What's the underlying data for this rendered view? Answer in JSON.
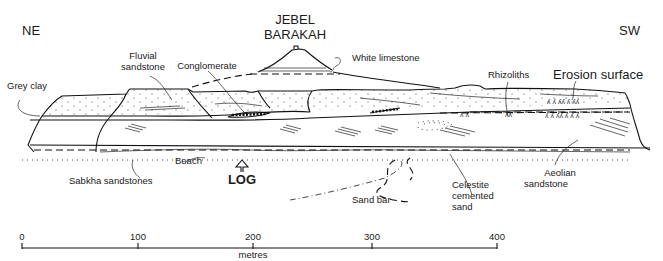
{
  "diagram": {
    "type": "geological cross-section",
    "orientation": {
      "left": "NE",
      "right": "SW"
    },
    "title": {
      "line1": "JEBEL",
      "line2": "BARAKAH"
    },
    "labels": {
      "white_limestone": "White limestone",
      "fluvial_sandstone_1": "Fluvial",
      "fluvial_sandstone_2": "sandstone",
      "conglomerate": "Conglomerate",
      "grey_clay": "Grey clay",
      "rhizoliths": "Rhizoliths",
      "erosion_surface": "Erosion surface",
      "beach": "Beach",
      "sabkha_sandstones": "Sabkha sandstones",
      "log": "LOG",
      "sand_bar": "Sand bar",
      "celestite_1": "Celestite",
      "celestite_2": "cemented",
      "celestite_3": "sand",
      "aeolian_1": "Aeolian",
      "aeolian_2": "sandstone"
    },
    "scale_bar": {
      "ticks": [
        "0",
        "100",
        "200",
        "300",
        "400"
      ],
      "unit": "metres"
    }
  }
}
